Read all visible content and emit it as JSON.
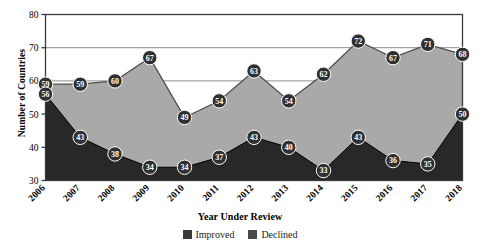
{
  "chart_data": {
    "type": "area",
    "title": "",
    "xlabel": "Year Under Review",
    "ylabel": "Number of Countries",
    "categories": [
      "2006",
      "2007",
      "2008",
      "2009",
      "2010",
      "2011",
      "2012",
      "2013",
      "2014",
      "2015",
      "2016",
      "2017",
      "2018"
    ],
    "ylim": [
      30,
      80
    ],
    "yticks": [
      30,
      40,
      50,
      60,
      70,
      80
    ],
    "grid": true,
    "legend_position": "bottom",
    "series": [
      {
        "name": "Improved",
        "color": "#a9a9a9",
        "values": [
          59,
          59,
          60,
          67,
          49,
          54,
          63,
          54,
          62,
          72,
          67,
          71,
          68
        ]
      },
      {
        "name": "Declined",
        "color": "#282828",
        "values": [
          56,
          43,
          38,
          34,
          34,
          37,
          43,
          40,
          33,
          43,
          36,
          35,
          50
        ]
      }
    ]
  },
  "colors": {
    "improved_fill": "#a9a9a9",
    "declined_fill": "#282828",
    "marker_fill": "#303030",
    "marker_text": "#ffffff",
    "axis": "#3a3a3a",
    "grid": "#8c8c8c",
    "background": "#ffffff"
  },
  "legend": {
    "items": [
      {
        "label": "Improved",
        "swatch": "#3a3a3a"
      },
      {
        "label": "Declined",
        "swatch": "#4a4a4a"
      }
    ]
  }
}
